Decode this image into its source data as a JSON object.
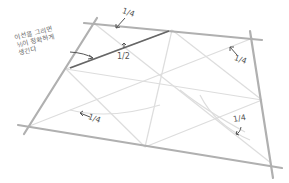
{
  "diagram": {
    "colors": {
      "frame": "#b3b3b3",
      "guide": "#dcdcdc",
      "highlight_line": "#666666",
      "text": "#555555"
    },
    "corners": {
      "top_left": [
        95,
        24
      ],
      "top_right": [
        253,
        38
      ],
      "bottom_right": [
        271,
        163
      ],
      "bottom_left": [
        27,
        127
      ]
    },
    "note": {
      "lines": [
        "이선을 그리면",
        "½이 정확하게",
        "생긴다"
      ]
    },
    "labels": [
      {
        "id": "top-quarter",
        "text": "1/4"
      },
      {
        "id": "half",
        "text": "1/2"
      },
      {
        "id": "right-quarter",
        "text": "1/4"
      },
      {
        "id": "left-quarter",
        "text": "1/4"
      },
      {
        "id": "bottom-right-quarter",
        "text": "1/4"
      }
    ]
  }
}
